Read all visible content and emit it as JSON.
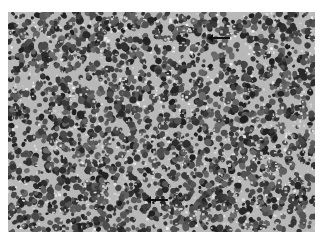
{
  "image": {
    "description": "Grayscale light micrograph of densely packed small round cells (histology section)",
    "colors": {
      "background": "#ffffff",
      "tissue_mid": "#8a8a8a",
      "nuclei": "#2a2a2a",
      "stroma": "#e0e0e0"
    },
    "annotations": [
      {
        "type": "arrow",
        "direction": "left",
        "x": 210,
        "y": 38
      },
      {
        "type": "arrow",
        "direction": "left",
        "x": 150,
        "y": 200
      }
    ]
  }
}
